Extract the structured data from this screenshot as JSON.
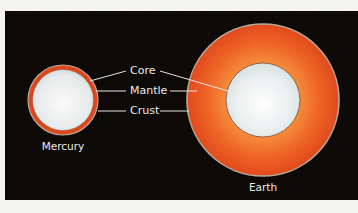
{
  "diagram": {
    "type": "planet-interior-comparison",
    "colors": {
      "background": "#0c0806",
      "mantle": "#e8501e",
      "mantle_highlight": "#f58a3c",
      "core": "#e6ecec",
      "crust_outline": "#b9a99a",
      "label_text": "#ecebe6"
    },
    "layer_labels": [
      "Core",
      "Mantle",
      "Crust"
    ],
    "planets": [
      {
        "name": "Mercury"
      },
      {
        "name": "Earth"
      }
    ]
  }
}
